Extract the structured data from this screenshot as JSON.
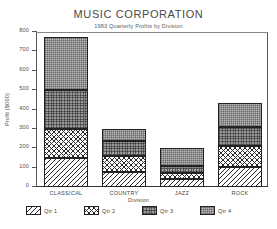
{
  "chart_data": {
    "type": "bar",
    "subtype": "stacked-bar",
    "title": "MUSIC CORPORATION",
    "subtitle": "1983 Quarterly Profits by Division",
    "xlabel": "Division",
    "ylabel": "Profit ($000)",
    "categories": [
      "CLASSICAL",
      "COUNTRY",
      "JAZZ",
      "ROCK"
    ],
    "series": [
      {
        "name": "Qtr 1",
        "values": [
          150,
          80,
          40,
          105
        ],
        "pattern": "diagonal-hatch"
      },
      {
        "name": "Qtr 2",
        "values": [
          150,
          80,
          32,
          105
        ],
        "pattern": "cross-hatch"
      },
      {
        "name": "Qtr 3",
        "values": [
          200,
          75,
          38,
          100
        ],
        "pattern": "dark-dotted"
      },
      {
        "name": "Qtr 4",
        "values": [
          275,
          63,
          90,
          125
        ],
        "pattern": "light-dotted"
      }
    ],
    "totals": [
      775,
      298,
      200,
      435
    ],
    "ylim": [
      0,
      800
    ],
    "yticks": [
      0,
      100,
      200,
      300,
      400,
      500,
      600,
      700,
      800
    ],
    "ytick_labels": [
      "0",
      "100",
      "200",
      "300",
      "400",
      "500",
      "600",
      "700",
      "800"
    ],
    "grid": false,
    "legend_position": "bottom",
    "colors": {
      "axis": "#555555",
      "text": "#444444",
      "qtr3_fill": "#9a9a9a",
      "qtr4_fill": "#b9b9b9",
      "background": "#ffffff"
    }
  },
  "legend": {
    "items": [
      {
        "label": "Qtr 1"
      },
      {
        "label": "Qtr 2"
      },
      {
        "label": "Qtr 3"
      },
      {
        "label": "Qtr 4"
      }
    ]
  }
}
